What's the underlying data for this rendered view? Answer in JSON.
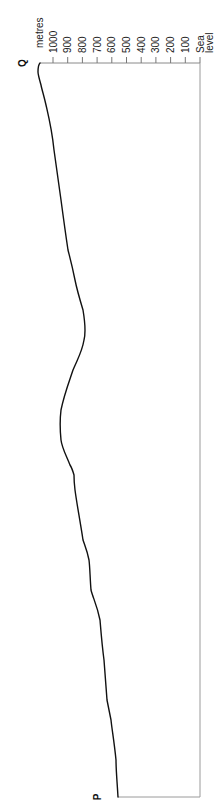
{
  "chart_data": {
    "type": "line",
    "title": "",
    "orientation": "rotated 90 degrees clockwise (distance runs bottom-to-top, height runs right-to-left)",
    "xlabel": "Distance from P to Q",
    "ylabel": "metres",
    "y_ticks": [
      "Sea level",
      "100",
      "200",
      "300",
      "400",
      "500",
      "600",
      "700",
      "800",
      "900",
      "1000"
    ],
    "ylim": [
      0,
      1100
    ],
    "grid": false,
    "legend": null,
    "start_label": "P",
    "end_label": "Q",
    "x": [
      0,
      5,
      10,
      13,
      18,
      24,
      28,
      32,
      35,
      42,
      45,
      49,
      53,
      58,
      60,
      63,
      66,
      70,
      73,
      75,
      82,
      88,
      90,
      94,
      97,
      98,
      99,
      100
    ],
    "values": [
      558,
      571,
      605,
      633,
      653,
      680,
      741,
      755,
      796,
      850,
      864,
      905,
      946,
      946,
      905,
      864,
      816,
      782,
      795,
      830,
      871,
      946,
      960,
      986,
      1048,
      1082,
      1102,
      1088
    ]
  },
  "axis": {
    "unit_label": "metres",
    "ticks": [
      {
        "value": 1000,
        "label": "1000"
      },
      {
        "value": 900,
        "label": "900"
      },
      {
        "value": 800,
        "label": "800"
      },
      {
        "value": 700,
        "label": "700"
      },
      {
        "value": 600,
        "label": "600"
      },
      {
        "value": 500,
        "label": "500"
      },
      {
        "value": 400,
        "label": "400"
      },
      {
        "value": 300,
        "label": "300"
      },
      {
        "value": 200,
        "label": "200"
      },
      {
        "value": 100,
        "label": "100"
      },
      {
        "value": 0,
        "label": "Sea",
        "label2": "level"
      }
    ]
  },
  "labels": {
    "start": "P",
    "end": "Q"
  },
  "colors": {
    "line": "#111111",
    "frame": "#9a9a9a",
    "text": "#222222"
  }
}
